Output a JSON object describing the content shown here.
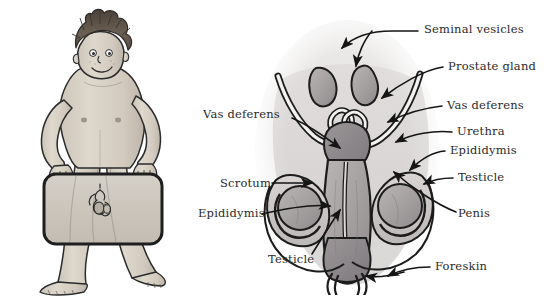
{
  "figure": {
    "background_color": "#ffffff",
    "text_color": "#2b2b2b",
    "line_color": "#1a1a1a"
  },
  "panels": {
    "left": {
      "name": "boy-holding-sign",
      "description": "Watercolour cartoon of a standing boy with spiky brown hair holding a rounded rectangular panel in front of his hips showing an internal view of the testicles",
      "skin_color": "#d9d2c7",
      "hair_color": "#5c5148",
      "panel_fill": "#cfcac2",
      "panel_border": "#2a2a2a"
    },
    "right": {
      "name": "anatomy-cross-section",
      "description": "Grey watercolour cross-section of the male reproductive organs",
      "tone_light": "#cfcbc8",
      "tone_mid": "#a9a5a4",
      "tone_dark": "#8d898b",
      "outline": "#1c1c1c"
    }
  },
  "labels": {
    "right_side": [
      {
        "id": "seminal-vesicles",
        "text": "Seminal vesicles",
        "x": 424,
        "y": 24
      },
      {
        "id": "prostate-gland",
        "text": "Prostate gland",
        "x": 448,
        "y": 66
      },
      {
        "id": "vas-deferens-right",
        "text": "Vas deferens",
        "x": 447,
        "y": 105
      },
      {
        "id": "urethra",
        "text": "Urethra",
        "x": 457,
        "y": 131
      },
      {
        "id": "epididymis-right",
        "text": "Epididymis",
        "x": 450,
        "y": 150
      },
      {
        "id": "testicle-right",
        "text": "Testicle",
        "x": 458,
        "y": 177
      },
      {
        "id": "penis",
        "text": "Penis",
        "x": 458,
        "y": 213
      },
      {
        "id": "foreskin",
        "text": "Foreskin",
        "x": 435,
        "y": 266
      }
    ],
    "left_side": [
      {
        "id": "vas-deferens-left",
        "text": "Vas deferens",
        "x": 203,
        "y": 114
      },
      {
        "id": "scrotum",
        "text": "Scrotum",
        "x": 220,
        "y": 178
      },
      {
        "id": "epididymis-left",
        "text": "Epididymis",
        "x": 198,
        "y": 213
      },
      {
        "id": "testicle-left",
        "text": "Testicle",
        "x": 268,
        "y": 259
      }
    ]
  }
}
